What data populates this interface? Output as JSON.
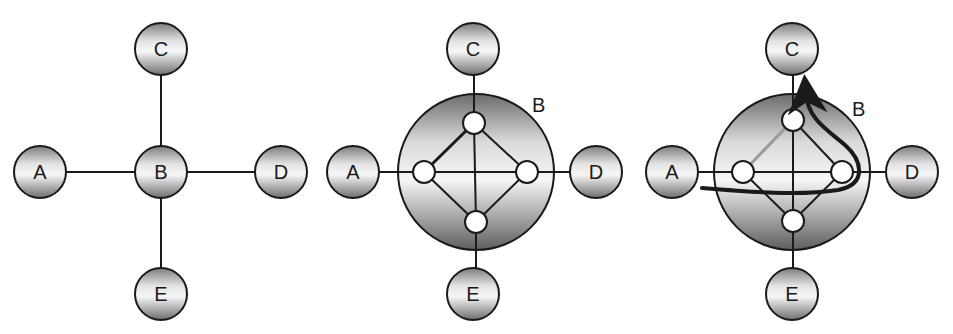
{
  "figure": {
    "panels": [
      {
        "id": "panel-1",
        "description": "Star topology with central node B",
        "nodes": [
          {
            "label": "A",
            "cx": 40,
            "cy": 172,
            "r": 26
          },
          {
            "label": "B",
            "cx": 161,
            "cy": 172,
            "r": 26
          },
          {
            "label": "C",
            "cx": 161,
            "cy": 49,
            "r": 26
          },
          {
            "label": "D",
            "cx": 281,
            "cy": 172,
            "r": 26
          },
          {
            "label": "E",
            "cx": 161,
            "cy": 294,
            "r": 26
          }
        ]
      },
      {
        "id": "panel-2",
        "description": "Node B expanded to show internal mesh of four sub-nodes",
        "big_node_label": "B",
        "nodes": [
          {
            "label": "A",
            "cx": 353,
            "cy": 172,
            "r": 26
          },
          {
            "label": "C",
            "cx": 473,
            "cy": 49,
            "r": 26
          },
          {
            "label": "D",
            "cx": 596,
            "cy": 172,
            "r": 26
          },
          {
            "label": "E",
            "cx": 473,
            "cy": 294,
            "r": 26
          }
        ]
      },
      {
        "id": "panel-3",
        "description": "Path from A through B's internal nodes to C, with one internal link greyed out",
        "big_node_label": "B",
        "nodes": [
          {
            "label": "A",
            "cx": 672,
            "cy": 172,
            "r": 26
          },
          {
            "label": "C",
            "cx": 792,
            "cy": 49,
            "r": 26
          },
          {
            "label": "D",
            "cx": 912,
            "cy": 172,
            "r": 26
          },
          {
            "label": "E",
            "cx": 792,
            "cy": 294,
            "r": 26
          }
        ]
      }
    ],
    "colors": {
      "stroke": "#1a1a1a",
      "node_light": "#f4f4f4",
      "node_dark": "#8c8c8c",
      "disabled_link": "#9a9a9a",
      "background": "#ffffff"
    }
  }
}
